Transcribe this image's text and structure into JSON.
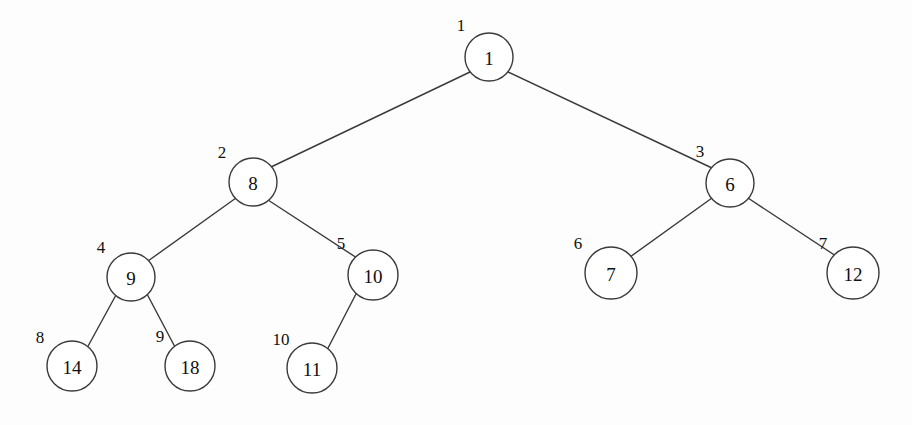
{
  "figure": {
    "background_color": "#fdfdfd",
    "stroke_color": "#3a3a3a",
    "text_color": "#101010",
    "width": 912,
    "height": 425
  },
  "chart_data": {
    "type": "diagram",
    "diagram_kind": "binary-tree",
    "title": "",
    "nodes": [
      {
        "id": "n1",
        "index": "1",
        "value": "1",
        "cx": 489,
        "cy": 57,
        "r": 24,
        "index_x": 461,
        "index_y": 25
      },
      {
        "id": "n2",
        "index": "2",
        "value": "8",
        "cx": 253,
        "cy": 182,
        "r": 24,
        "index_x": 222,
        "index_y": 152
      },
      {
        "id": "n3",
        "index": "3",
        "value": "6",
        "cx": 730,
        "cy": 183,
        "r": 24,
        "index_x": 700,
        "index_y": 151
      },
      {
        "id": "n4",
        "index": "4",
        "value": "9",
        "cx": 131,
        "cy": 277,
        "r": 24,
        "index_x": 101,
        "index_y": 247
      },
      {
        "id": "n5",
        "index": "5",
        "value": "10",
        "cx": 373,
        "cy": 275,
        "r": 25,
        "index_x": 341,
        "index_y": 243
      },
      {
        "id": "n6",
        "index": "6",
        "value": "7",
        "cx": 611,
        "cy": 273,
        "r": 26,
        "index_x": 578,
        "index_y": 243
      },
      {
        "id": "n7",
        "index": "7",
        "value": "12",
        "cx": 853,
        "cy": 273,
        "r": 26,
        "index_x": 823,
        "index_y": 243
      },
      {
        "id": "n8",
        "index": "8",
        "value": "14",
        "cx": 72,
        "cy": 366,
        "r": 25,
        "index_x": 40,
        "index_y": 337
      },
      {
        "id": "n9",
        "index": "9",
        "value": "18",
        "cx": 190,
        "cy": 366,
        "r": 25,
        "index_x": 160,
        "index_y": 336
      },
      {
        "id": "n10",
        "index": "10",
        "value": "11",
        "cx": 312,
        "cy": 368,
        "r": 25,
        "index_x": 281,
        "index_y": 339
      }
    ],
    "edges": [
      {
        "from": "n1",
        "to": "n2",
        "x1": 470,
        "y1": 72,
        "x2": 271,
        "y2": 167
      },
      {
        "from": "n1",
        "to": "n3",
        "x1": 508,
        "y1": 72,
        "x2": 712,
        "y2": 168
      },
      {
        "from": "n2",
        "to": "n4",
        "x1": 236,
        "y1": 198,
        "x2": 148,
        "y2": 261
      },
      {
        "from": "n2",
        "to": "n5",
        "x1": 268,
        "y1": 200,
        "x2": 357,
        "y2": 258
      },
      {
        "from": "n3",
        "to": "n6",
        "x1": 712,
        "y1": 198,
        "x2": 630,
        "y2": 257
      },
      {
        "from": "n3",
        "to": "n7",
        "x1": 748,
        "y1": 198,
        "x2": 836,
        "y2": 256
      },
      {
        "from": "n4",
        "to": "n8",
        "x1": 116,
        "y1": 295,
        "x2": 87,
        "y2": 348
      },
      {
        "from": "n4",
        "to": "n9",
        "x1": 147,
        "y1": 294,
        "x2": 175,
        "y2": 347
      },
      {
        "from": "n5",
        "to": "n10",
        "x1": 357,
        "y1": 292,
        "x2": 327,
        "y2": 350
      }
    ]
  }
}
